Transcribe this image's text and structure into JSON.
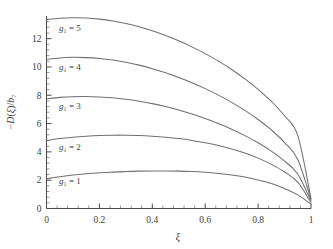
{
  "chart_data": {
    "type": "line",
    "title": "",
    "subtitle": "",
    "xlabel": "ξ",
    "ylabel": "−D(ξ)/b₇",
    "xlim": [
      0,
      1
    ],
    "ylim": [
      0,
      13.6
    ],
    "grid": false,
    "legend_position": "inline-curve-labels",
    "xticks": [
      0,
      0.2,
      0.4,
      0.6,
      0.8,
      1
    ],
    "xtick_labels": [
      "0",
      "0.2",
      "0.4",
      "0.6",
      "0.8",
      "1"
    ],
    "x_minor_tick_count": 4,
    "yticks": [
      0,
      2,
      4,
      6,
      8,
      10,
      12
    ],
    "ytick_labels": [
      "0",
      "2",
      "4",
      "6",
      "8",
      "10",
      "12"
    ],
    "y_minor_tick_count": 4,
    "x": [
      0,
      0.05,
      0.1,
      0.15,
      0.2,
      0.25,
      0.3,
      0.35,
      0.4,
      0.45,
      0.5,
      0.55,
      0.6,
      0.65,
      0.7,
      0.75,
      0.8,
      0.85,
      0.9,
      0.95,
      1
    ],
    "series": [
      {
        "name": "g₁ = 1",
        "label": "g₁ = 1",
        "label_x": 0.04,
        "label_y": 1.75,
        "color": "#707070",
        "values": [
          2.1,
          2.24,
          2.36,
          2.45,
          2.52,
          2.57,
          2.61,
          2.64,
          2.65,
          2.65,
          2.64,
          2.61,
          2.56,
          2.48,
          2.37,
          2.22,
          2.02,
          1.76,
          1.42,
          0.96,
          0.3
        ]
      },
      {
        "name": "g₁ = 2",
        "label": "g₁ = 2",
        "label_x": 0.04,
        "label_y": 4.15,
        "color": "#707070",
        "values": [
          4.8,
          4.94,
          5.04,
          5.11,
          5.16,
          5.18,
          5.18,
          5.16,
          5.11,
          5.04,
          4.94,
          4.81,
          4.65,
          4.45,
          4.21,
          3.92,
          3.56,
          3.12,
          2.58,
          1.86,
          0.42
        ]
      },
      {
        "name": "g₁ = 3",
        "label": "g₁ = 3",
        "label_x": 0.04,
        "label_y": 7.05,
        "color": "#707070",
        "values": [
          7.75,
          7.85,
          7.9,
          7.91,
          7.88,
          7.82,
          7.72,
          7.58,
          7.41,
          7.2,
          6.96,
          6.68,
          6.36,
          6.0,
          5.6,
          5.15,
          4.64,
          4.05,
          3.35,
          2.44,
          0.52
        ]
      },
      {
        "name": "g₁ = 4",
        "label": "g₁ = 4",
        "label_x": 0.04,
        "label_y": 9.8,
        "color": "#707070",
        "values": [
          10.55,
          10.64,
          10.68,
          10.66,
          10.6,
          10.49,
          10.33,
          10.13,
          9.88,
          9.59,
          9.26,
          8.89,
          8.47,
          8.01,
          7.5,
          6.93,
          6.29,
          5.55,
          4.66,
          3.46,
          0.62
        ]
      },
      {
        "name": "g₁ = 5",
        "label": "g₁ = 5",
        "label_x": 0.04,
        "label_y": 12.55,
        "color": "#707070",
        "values": [
          13.35,
          13.44,
          13.48,
          13.46,
          13.38,
          13.25,
          13.07,
          12.84,
          12.56,
          12.23,
          11.85,
          11.42,
          10.94,
          10.41,
          9.82,
          9.16,
          8.42,
          7.57,
          6.55,
          5.16,
          0.7
        ]
      }
    ]
  },
  "figure": {
    "background_color": "#ffffff",
    "axis_color": "#4a4a4a",
    "curve_color": "#707070",
    "text_color": "#3c3c3c"
  }
}
